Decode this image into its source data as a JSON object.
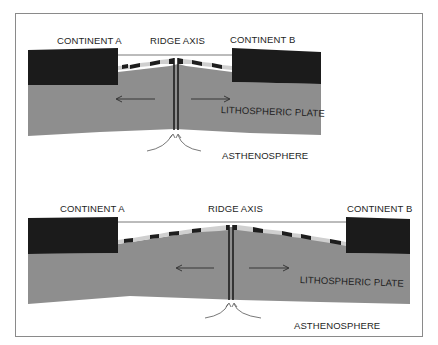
{
  "colors": {
    "continent": "#1b1b1b",
    "plate": "#8e8e8e",
    "stripe_light": "#cfcfcf",
    "stripe_dark": "#1e1e1e",
    "line": "#555555",
    "frame": "#8a8a8a",
    "text": "#1e1e1e"
  },
  "top_panel": {
    "continent_a": "CONTINENT A",
    "ridge_axis": "RIDGE AXIS",
    "continent_b": "CONTINENT B",
    "plate_label": "LITHOSPHERIC PLATE",
    "asthenosphere": "ASTHENOSPHERE",
    "stage": "early spreading"
  },
  "bottom_panel": {
    "continent_a": "CONTINENT A",
    "ridge_axis": "RIDGE AXIS",
    "continent_b": "CONTINENT B",
    "plate_label": "LITHOSPHERIC PLATE",
    "asthenosphere": "ASTHENOSPHERE",
    "stage": "later spreading"
  }
}
